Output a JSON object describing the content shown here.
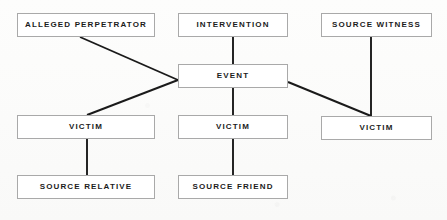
{
  "diagram": {
    "type": "flowchart",
    "background_color": "#fdfdfc",
    "box_border_color": "#a9a9a9",
    "box_fill_color": "#ffffff",
    "connector_color": "#1a1a1a",
    "nodes": [
      {
        "id": "alleged-perpetrator",
        "label": "ALLEGED PERPETRATOR",
        "x": 17,
        "y": 13,
        "w": 138,
        "h": 24
      },
      {
        "id": "intervention",
        "label": "INTERVENTION",
        "x": 178,
        "y": 13,
        "w": 110,
        "h": 24
      },
      {
        "id": "source-witness",
        "label": "SOURCE WITNESS",
        "x": 321,
        "y": 13,
        "w": 111,
        "h": 24
      },
      {
        "id": "event",
        "label": "EVENT",
        "x": 178,
        "y": 64,
        "w": 110,
        "h": 24
      },
      {
        "id": "victim-left",
        "label": "VICTIM",
        "x": 17,
        "y": 115,
        "w": 138,
        "h": 24
      },
      {
        "id": "victim-center",
        "label": "VICTIM",
        "x": 178,
        "y": 115,
        "w": 110,
        "h": 24
      },
      {
        "id": "victim-right",
        "label": "VICTIM",
        "x": 321,
        "y": 116,
        "w": 111,
        "h": 24
      },
      {
        "id": "source-relative",
        "label": "SOURCE RELATIVE",
        "x": 17,
        "y": 175,
        "w": 138,
        "h": 24
      },
      {
        "id": "source-friend",
        "label": "SOURCE FRIEND",
        "x": 178,
        "y": 175,
        "w": 110,
        "h": 24
      }
    ],
    "edges": [
      {
        "id": "edge-alleged-perpetrator-event",
        "from": "alleged-perpetrator",
        "to": "event",
        "x1": 80,
        "y1": 37,
        "x2": 178,
        "y2": 80
      },
      {
        "id": "edge-event-victim-left",
        "from": "event",
        "to": "victim-left",
        "x1": 178,
        "y1": 80,
        "x2": 87,
        "y2": 115
      },
      {
        "id": "edge-intervention-event",
        "from": "intervention",
        "to": "event",
        "x1": 233,
        "y1": 37,
        "x2": 233,
        "y2": 64
      },
      {
        "id": "edge-event-victim-center",
        "from": "event",
        "to": "victim-center",
        "x1": 233,
        "y1": 88,
        "x2": 233,
        "y2": 115
      },
      {
        "id": "edge-event-victim-right",
        "from": "event",
        "to": "victim-right",
        "x1": 288,
        "y1": 82,
        "x2": 371,
        "y2": 116
      },
      {
        "id": "edge-source-witness-victim-right",
        "from": "source-witness",
        "to": "victim-right",
        "x1": 371,
        "y1": 37,
        "x2": 371,
        "y2": 116
      },
      {
        "id": "edge-victim-left-source-relative",
        "from": "victim-left",
        "to": "source-relative",
        "x1": 87,
        "y1": 139,
        "x2": 87,
        "y2": 175
      },
      {
        "id": "edge-victim-center-source-friend",
        "from": "victim-center",
        "to": "source-friend",
        "x1": 233,
        "y1": 139,
        "x2": 233,
        "y2": 175
      }
    ]
  }
}
